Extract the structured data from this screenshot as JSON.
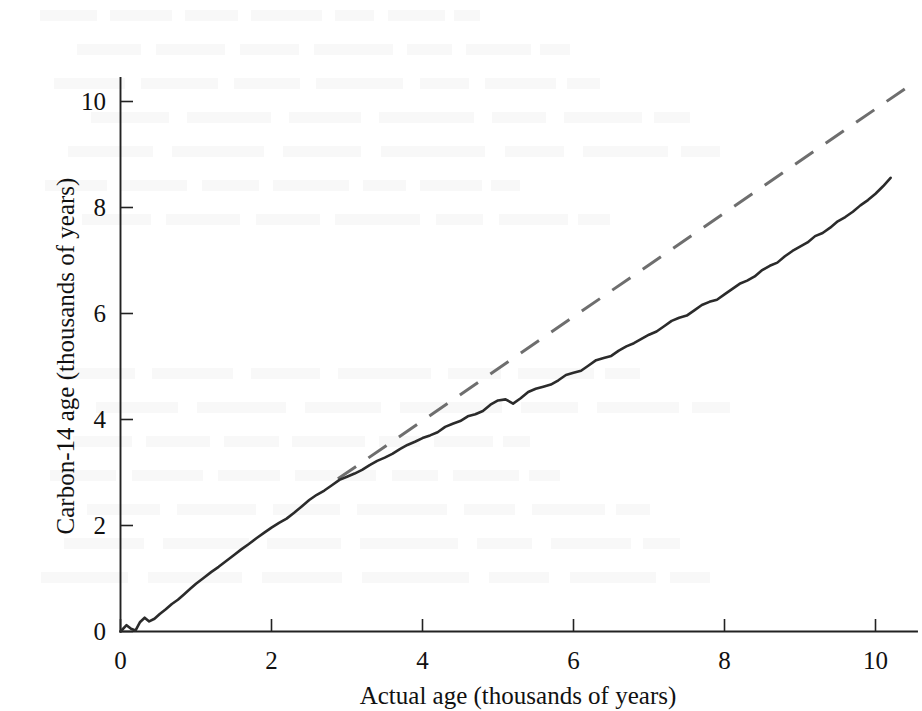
{
  "figure": {
    "background_color": "#ffffff",
    "ink_color": "#2b2b2b",
    "reference_color": "#6e6e6e"
  },
  "ghost_text_lines": 14,
  "chart_data": {
    "type": "line",
    "title": "",
    "xlabel": "Actual age (thousands of years)",
    "ylabel": "Carbon-14 age (thousands of years)",
    "xlim": [
      0,
      10.6
    ],
    "ylim": [
      0,
      10.6
    ],
    "xticks": [
      0,
      2,
      4,
      6,
      8,
      10
    ],
    "xticklabels": [
      "0",
      "2",
      "4",
      "6",
      "8",
      "10"
    ],
    "yticks": [
      0,
      2,
      4,
      6,
      8,
      10
    ],
    "yticklabels": [
      "0",
      "2",
      "4",
      "6",
      "8",
      "10"
    ],
    "grid": false,
    "legend": "none",
    "tick_direction": "in",
    "series": [
      {
        "name": "Carbon-14 calibration curve",
        "style": "solid",
        "color": "#2b2b2b",
        "x": [
          0.0,
          0.08,
          0.14,
          0.2,
          0.26,
          0.32,
          0.38,
          0.45,
          0.52,
          0.6,
          0.68,
          0.76,
          0.84,
          0.92,
          1.0,
          1.1,
          1.2,
          1.3,
          1.4,
          1.5,
          1.6,
          1.7,
          1.8,
          1.9,
          2.0,
          2.1,
          2.2,
          2.3,
          2.4,
          2.5,
          2.6,
          2.7,
          2.8,
          2.9,
          3.0,
          3.1,
          3.2,
          3.3,
          3.4,
          3.5,
          3.6,
          3.7,
          3.8,
          3.9,
          4.0,
          4.1,
          4.2,
          4.3,
          4.4,
          4.5,
          4.6,
          4.7,
          4.8,
          4.9,
          5.0,
          5.1,
          5.2,
          5.3,
          5.4,
          5.5,
          5.6,
          5.7,
          5.8,
          5.9,
          6.0,
          6.1,
          6.2,
          6.3,
          6.4,
          6.5,
          6.6,
          6.7,
          6.8,
          6.9,
          7.0,
          7.1,
          7.2,
          7.3,
          7.4,
          7.5,
          7.6,
          7.7,
          7.8,
          7.9,
          8.0,
          8.1,
          8.2,
          8.3,
          8.4,
          8.5,
          8.6,
          8.7,
          8.8,
          8.9,
          9.0,
          9.1,
          9.2,
          9.3,
          9.4,
          9.5,
          9.6,
          9.7,
          9.8,
          9.9,
          10.0,
          10.1,
          10.2
        ],
        "y": [
          0.0,
          0.12,
          0.05,
          0.02,
          0.18,
          0.26,
          0.19,
          0.24,
          0.33,
          0.42,
          0.52,
          0.6,
          0.7,
          0.8,
          0.9,
          1.01,
          1.12,
          1.22,
          1.33,
          1.44,
          1.55,
          1.65,
          1.76,
          1.86,
          1.96,
          2.05,
          2.13,
          2.24,
          2.36,
          2.48,
          2.58,
          2.66,
          2.76,
          2.86,
          2.92,
          2.98,
          3.05,
          3.14,
          3.22,
          3.28,
          3.35,
          3.44,
          3.52,
          3.58,
          3.65,
          3.7,
          3.76,
          3.86,
          3.92,
          3.97,
          4.06,
          4.1,
          4.16,
          4.28,
          4.36,
          4.38,
          4.3,
          4.4,
          4.52,
          4.58,
          4.62,
          4.66,
          4.74,
          4.84,
          4.88,
          4.92,
          5.02,
          5.12,
          5.16,
          5.2,
          5.3,
          5.38,
          5.44,
          5.52,
          5.6,
          5.66,
          5.76,
          5.86,
          5.92,
          5.96,
          6.06,
          6.16,
          6.22,
          6.26,
          6.36,
          6.46,
          6.56,
          6.62,
          6.7,
          6.82,
          6.9,
          6.96,
          7.08,
          7.18,
          7.26,
          7.34,
          7.46,
          7.52,
          7.62,
          7.74,
          7.82,
          7.92,
          8.04,
          8.14,
          8.26,
          8.4,
          8.56
        ]
      },
      {
        "name": "1:1 reference line",
        "style": "dashed",
        "color": "#6e6e6e",
        "x": [
          2.88,
          10.4
        ],
        "y": [
          2.88,
          10.25
        ]
      }
    ]
  }
}
